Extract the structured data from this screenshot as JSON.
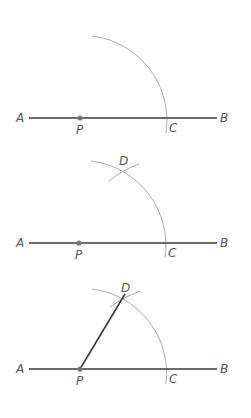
{
  "colors": {
    "segment": "#3a3a3a",
    "arc": "#aaaaaa",
    "point": "#777777",
    "label": "#555555"
  },
  "panels": [
    {
      "step": 1,
      "description": "Arc centered at P crossing AB at C",
      "labels": {
        "a": "A",
        "b": "B",
        "p": "P",
        "c": "C"
      }
    },
    {
      "step": 2,
      "description": "Arc centered at C crossing first arc at D",
      "labels": {
        "a": "A",
        "b": "B",
        "p": "P",
        "c": "C",
        "d": "D"
      }
    },
    {
      "step": 3,
      "description": "Segment PD drawn",
      "labels": {
        "a": "A",
        "b": "B",
        "p": "P",
        "c": "C",
        "d": "D"
      }
    }
  ]
}
